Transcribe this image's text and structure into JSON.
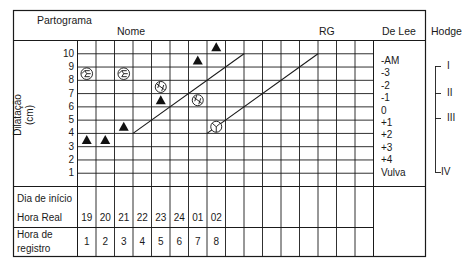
{
  "header": {
    "title": "Partograma",
    "name_label": "Nome",
    "rg_label": "RG",
    "delee_label": "De Lee",
    "hodge_label": "Hodge"
  },
  "y_axis": {
    "label_line1": "Dilatação",
    "label_line2": "(cm)",
    "ticks": [
      "10",
      "9",
      "8",
      "7",
      "6",
      "5",
      "4",
      "3",
      "2",
      "1"
    ]
  },
  "delee_stations": [
    "-AM",
    "-3",
    "-2",
    "-1",
    "0",
    "+1",
    "+2",
    "+3",
    "+4",
    "Vulva"
  ],
  "hodge_planes": [
    "I",
    "II",
    "III",
    "IV"
  ],
  "footer": {
    "start_day_label": "Dia de início",
    "real_hour_label": "Hora Real",
    "record_hour_label_line1": "Hora de",
    "record_hour_label_line2": "registro",
    "real_hours": [
      "19",
      "20",
      "21",
      "22",
      "23",
      "24",
      "01",
      "02"
    ],
    "record_hours": [
      "1",
      "2",
      "3",
      "4",
      "5",
      "6",
      "7",
      "8"
    ]
  },
  "chart_data": {
    "type": "scatter",
    "title": "Partograma",
    "xlabel": "Hora de registro",
    "ylabel": "Dilatação (cm)",
    "ylim": [
      0,
      10
    ],
    "grid": true,
    "columns_total": 16,
    "series": [
      {
        "name": "Dilatação (triângulo)",
        "marker": "filled-triangle",
        "points": [
          {
            "x": 1,
            "hour": "19",
            "y": 3.5
          },
          {
            "x": 2,
            "hour": "20",
            "y": 3.5
          },
          {
            "x": 3,
            "hour": "21",
            "y": 4.5
          },
          {
            "x": 5,
            "hour": "23",
            "y": 6.5
          },
          {
            "x": 7,
            "hour": "01",
            "y": 9.5
          },
          {
            "x": 8,
            "hour": "02",
            "y": 10.5
          }
        ]
      },
      {
        "name": "Variedade de posição / altura da apresentação",
        "marker": "fetal-head-circle",
        "points": [
          {
            "x": 1,
            "hour": "19",
            "y": 8.5,
            "symbol": "head-occipital-left"
          },
          {
            "x": 3,
            "hour": "21",
            "y": 8.5,
            "symbol": "head-occipital-left"
          },
          {
            "x": 5,
            "hour": "23",
            "y": 7.5,
            "symbol": "head-rotated"
          },
          {
            "x": 7,
            "hour": "01",
            "y": 6.5,
            "symbol": "head-rotated"
          },
          {
            "x": 8,
            "hour": "02",
            "y": 4.5,
            "symbol": "head-occipital-anterior"
          }
        ]
      }
    ],
    "reference_lines": [
      {
        "name": "Linha de alerta",
        "from": {
          "x": 3,
          "y": 4
        },
        "to": {
          "x": 9,
          "y": 10
        }
      },
      {
        "name": "Linha de ação",
        "from": {
          "x": 7,
          "y": 4
        },
        "to": {
          "x": 13,
          "y": 10
        }
      }
    ]
  }
}
